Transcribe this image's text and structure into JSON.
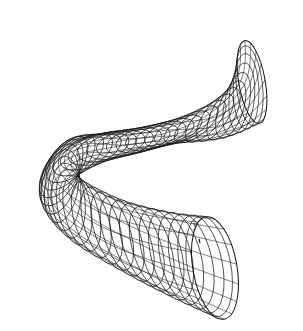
{
  "figure": {
    "axis_label": "y",
    "line_color": "#1a1a1a",
    "background": "#ffffff"
  }
}
